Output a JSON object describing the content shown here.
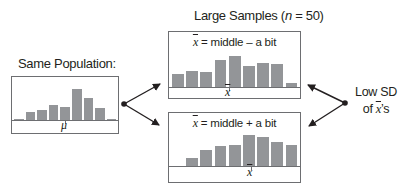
{
  "population": {
    "label": "Same Population:",
    "axis_symbol": "μ",
    "bars": [
      4,
      26,
      33,
      48,
      43,
      100,
      72,
      38,
      4
    ]
  },
  "samples": {
    "title_prefix": "Large Samples (",
    "title_n": "n",
    "title_suffix": " = 50)",
    "top": {
      "caption_symbol": "x",
      "caption_text": " = middle – a bit",
      "axis_symbol": "x",
      "bars": [
        38,
        47,
        44,
        78,
        92,
        62,
        72,
        69,
        12
      ]
    },
    "bottom": {
      "caption_symbol": "x",
      "caption_text": " = middle + a bit",
      "axis_symbol": "x",
      "bars": [
        0,
        24,
        47,
        58,
        62,
        92,
        84,
        70,
        62
      ]
    }
  },
  "annotation": {
    "line1": "Low SD",
    "line2_prefix": "of ",
    "line2_symbol": "x",
    "line2_suffix": "’s"
  },
  "colors": {
    "bar": "#939598",
    "border": "#6d6e71",
    "text": "#231f20",
    "arrow": "#231f20"
  }
}
